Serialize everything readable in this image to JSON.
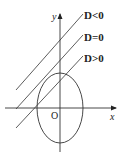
{
  "diagram": {
    "axes": {
      "x_label": "x",
      "y_label": "y",
      "origin_label": "O"
    },
    "lines": [
      {
        "label": "D<0",
        "relation": "no intersection"
      },
      {
        "label": "D=0",
        "relation": "tangent"
      },
      {
        "label": "D>0",
        "relation": "two intersections"
      }
    ],
    "ellipse": {
      "orientation": "vertical major axis",
      "center": "origin"
    },
    "colors": {
      "stroke": "#333333",
      "background": "#ffffff"
    }
  }
}
